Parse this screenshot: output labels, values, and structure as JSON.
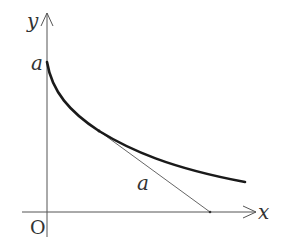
{
  "diagram": {
    "labels": {
      "y_axis": "y",
      "x_axis": "x",
      "origin": "O",
      "y_intercept": "a",
      "tangent_segment": "a"
    },
    "colors": {
      "curve": "#1a1a1a",
      "axes": "#555555",
      "tangent": "#666666",
      "text": "#333333",
      "background": "#ffffff"
    },
    "elements": [
      {
        "type": "axis",
        "name": "y-axis",
        "direction": "up"
      },
      {
        "type": "axis",
        "name": "x-axis",
        "direction": "right"
      },
      {
        "type": "curve",
        "name": "tractrix",
        "starts_at": "(0, a)",
        "asymptote": "x-axis"
      },
      {
        "type": "segment",
        "name": "tangent",
        "from": "point on curve",
        "to": "x-axis",
        "length_label": "a"
      }
    ]
  }
}
